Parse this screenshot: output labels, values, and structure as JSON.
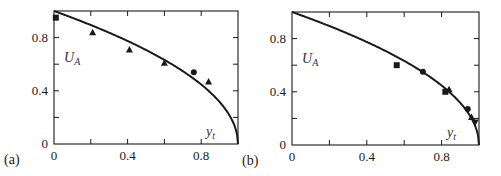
{
  "chart_data": [
    {
      "type": "scatter",
      "panel_label": "(a)",
      "title": "",
      "xlabel": "y_t",
      "ylabel": "U_A",
      "xlim": [
        0,
        1
      ],
      "ylim": [
        0,
        1
      ],
      "xticks": [
        0,
        0.4,
        0.8
      ],
      "xtick_labels": [
        "0",
        "0.4",
        "0.8"
      ],
      "yticks": [
        0,
        0.4,
        0.8
      ],
      "ytick_labels": [
        "0",
        "0.4",
        "0.8"
      ],
      "minor_ticks": [
        0.2,
        0.6
      ],
      "grid": false,
      "curve": {
        "name": "theory",
        "description": "U_A = sqrt(1 - y_t) style curve from (0,1) to (1,0)",
        "x": [
          0,
          0.1,
          0.2,
          0.3,
          0.4,
          0.5,
          0.6,
          0.7,
          0.8,
          0.9,
          0.95,
          0.99,
          1.0
        ],
        "y": [
          1.0,
          0.95,
          0.89,
          0.84,
          0.77,
          0.71,
          0.63,
          0.55,
          0.45,
          0.32,
          0.22,
          0.1,
          0.0
        ]
      },
      "series": [
        {
          "name": "squares",
          "marker": "square",
          "x": [
            0.01
          ],
          "y": [
            0.95
          ]
        },
        {
          "name": "triangles",
          "marker": "triangle",
          "x": [
            0.21,
            0.41,
            0.6,
            0.84
          ],
          "y": [
            0.84,
            0.71,
            0.61,
            0.47
          ]
        },
        {
          "name": "circles",
          "marker": "circle",
          "x": [
            0.76
          ],
          "y": [
            0.54
          ]
        }
      ]
    },
    {
      "type": "scatter",
      "panel_label": "(b)",
      "title": "",
      "xlabel": "y_t",
      "ylabel": "U_A",
      "xlim": [
        0,
        1
      ],
      "ylim": [
        0,
        1
      ],
      "xticks": [
        0,
        0.4,
        0.8
      ],
      "xtick_labels": [
        "0",
        "0.4",
        "0.8"
      ],
      "yticks": [
        0,
        0.4,
        0.8
      ],
      "ytick_labels": [
        "0",
        "0.4",
        "0.8"
      ],
      "minor_ticks": [
        0.2,
        0.6
      ],
      "grid": false,
      "curve": {
        "name": "theory",
        "description": "U_A = sqrt(1 - y_t) style curve from (0,1) to (1,0)",
        "x": [
          0,
          0.1,
          0.2,
          0.3,
          0.4,
          0.5,
          0.6,
          0.7,
          0.8,
          0.9,
          0.95,
          0.99,
          1.0
        ],
        "y": [
          1.0,
          0.95,
          0.89,
          0.84,
          0.77,
          0.71,
          0.63,
          0.55,
          0.45,
          0.32,
          0.22,
          0.1,
          0.0
        ]
      },
      "series": [
        {
          "name": "squares",
          "marker": "square",
          "x": [
            0.56,
            0.82
          ],
          "y": [
            0.6,
            0.4
          ]
        },
        {
          "name": "triangles",
          "marker": "triangle",
          "x": [
            0.84,
            0.96
          ],
          "y": [
            0.42,
            0.21
          ]
        },
        {
          "name": "circles",
          "marker": "circle",
          "x": [
            0.7,
            0.94
          ],
          "y": [
            0.55,
            0.27
          ]
        },
        {
          "name": "inverted-triangles",
          "marker": "triangle-down",
          "x": [
            0.98
          ],
          "y": [
            0.17
          ]
        }
      ]
    }
  ],
  "panels": [
    {
      "label": "(a)",
      "x_axis_label": "y",
      "x_axis_sub": "t",
      "y_axis_label": "U",
      "y_axis_sub": "A"
    },
    {
      "label": "(b)",
      "x_axis_label": "y",
      "x_axis_sub": "t",
      "y_axis_label": "U",
      "y_axis_sub": "A"
    }
  ],
  "colors": {
    "ink": "#1a1a1a",
    "background": "#ffffff"
  }
}
